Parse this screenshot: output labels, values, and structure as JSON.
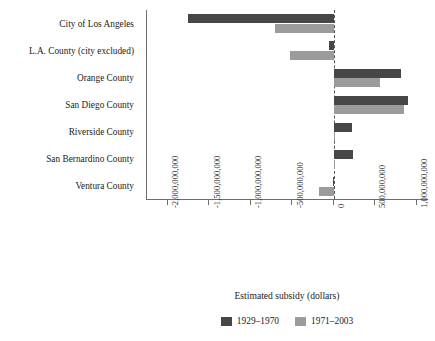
{
  "chart_data": {
    "type": "bar",
    "orientation": "horizontal",
    "title": "",
    "xlabel": "Estimated subsidy (dollars)",
    "ylabel": "",
    "xlim": [
      -2250000000,
      1150000000
    ],
    "xticks": [
      -2000000000,
      -1500000000,
      -1000000000,
      -500000000,
      0,
      500000000,
      1000000000
    ],
    "xtick_labels": [
      "-2,000,000,000",
      "-1,500,000,000",
      "-1,000,000,000",
      "-500,000,000",
      "0",
      "500,000,000",
      "1,000,000,000"
    ],
    "grid": false,
    "zero_line": true,
    "legend_position": "bottom",
    "categories": [
      "City of Los Angeles",
      "L.A. County (city excluded)",
      "Orange County",
      "San Diego County",
      "Riverside County",
      "San Bernardino County",
      "Ventura County"
    ],
    "series": [
      {
        "name": "1929–1970",
        "color": "#474747",
        "values": [
          -1760000000,
          -56000000,
          818000000,
          897000000,
          224000000,
          235000000,
          -11000000
        ]
      },
      {
        "name": "1971–2003",
        "color": "#9b9b9b",
        "values": [
          -706000000,
          -527000000,
          560000000,
          852000000,
          22000000,
          22000000,
          -180000000
        ]
      }
    ]
  },
  "axis": {
    "xlabel": "Estimated subsidy (dollars)"
  },
  "legend": {
    "items": [
      {
        "label": "1929–1970",
        "color": "#474747"
      },
      {
        "label": "1971–2003",
        "color": "#9b9b9b"
      }
    ]
  },
  "colors": {
    "series_1929_1970": "#474747",
    "series_1971_2003": "#9b9b9b",
    "axis": "#6d6d6d",
    "text": "#1b1b1b",
    "background": "#ffffff"
  }
}
